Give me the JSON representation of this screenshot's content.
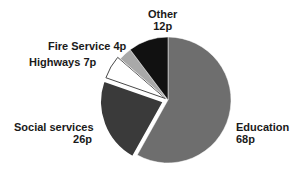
{
  "chart_data": {
    "type": "pie",
    "title": "",
    "unit": "p",
    "total": 117,
    "start_angle_deg": 0,
    "direction": "clockwise",
    "categories": [
      "Education",
      "Social services",
      "Highways",
      "Fire Service",
      "Other"
    ],
    "values": [
      68,
      26,
      7,
      4,
      12
    ],
    "colors": [
      "#6e6e6e",
      "#3a3a3a",
      "#ffffff",
      "#a9a9a9",
      "#111111"
    ],
    "exploded": [
      false,
      true,
      true,
      false,
      false
    ],
    "labels": [
      {
        "name": "Education",
        "value": "68p"
      },
      {
        "name": "Social services",
        "value": "26p"
      },
      {
        "name": "Highways 7p",
        "value": ""
      },
      {
        "name": "Fire Service 4p",
        "value": ""
      },
      {
        "name": "Other",
        "value": "12p"
      }
    ],
    "legend": "none (direct labels)"
  }
}
